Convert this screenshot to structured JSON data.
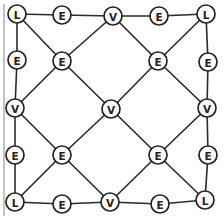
{
  "diagram": {
    "node_radius": 9,
    "nodes": [
      {
        "id": "n00",
        "label": "L",
        "x": 17,
        "y": 14
      },
      {
        "id": "n01",
        "label": "E",
        "x": 62,
        "y": 15
      },
      {
        "id": "n02",
        "label": "V",
        "x": 113,
        "y": 16
      },
      {
        "id": "n03",
        "label": "E",
        "x": 159,
        "y": 16
      },
      {
        "id": "n04",
        "label": "L",
        "x": 206,
        "y": 14
      },
      {
        "id": "n10",
        "label": "E",
        "x": 17,
        "y": 60
      },
      {
        "id": "n11",
        "label": "E",
        "x": 62,
        "y": 61
      },
      {
        "id": "n13",
        "label": "E",
        "x": 158,
        "y": 61
      },
      {
        "id": "n14",
        "label": "E",
        "x": 208,
        "y": 62
      },
      {
        "id": "n20",
        "label": "V",
        "x": 15,
        "y": 108
      },
      {
        "id": "n22",
        "label": "V",
        "x": 111,
        "y": 109
      },
      {
        "id": "n24",
        "label": "V",
        "x": 207,
        "y": 108
      },
      {
        "id": "n30",
        "label": "E",
        "x": 15,
        "y": 155
      },
      {
        "id": "n31",
        "label": "E",
        "x": 62,
        "y": 155
      },
      {
        "id": "n33",
        "label": "E",
        "x": 158,
        "y": 155
      },
      {
        "id": "n34",
        "label": "E",
        "x": 208,
        "y": 155
      },
      {
        "id": "n40",
        "label": "L",
        "x": 15,
        "y": 202
      },
      {
        "id": "n41",
        "label": "E",
        "x": 62,
        "y": 204
      },
      {
        "id": "n42",
        "label": "V",
        "x": 110,
        "y": 202
      },
      {
        "id": "n43",
        "label": "E",
        "x": 160,
        "y": 204
      },
      {
        "id": "n44",
        "label": "L",
        "x": 205,
        "y": 200
      }
    ],
    "edges": [
      [
        "n00",
        "n01"
      ],
      [
        "n01",
        "n02"
      ],
      [
        "n02",
        "n03"
      ],
      [
        "n03",
        "n04"
      ],
      [
        "n40",
        "n41"
      ],
      [
        "n41",
        "n42"
      ],
      [
        "n42",
        "n43"
      ],
      [
        "n43",
        "n44"
      ],
      [
        "n00",
        "n10"
      ],
      [
        "n10",
        "n20"
      ],
      [
        "n20",
        "n30"
      ],
      [
        "n30",
        "n40"
      ],
      [
        "n04",
        "n14"
      ],
      [
        "n14",
        "n24"
      ],
      [
        "n24",
        "n34"
      ],
      [
        "n34",
        "n44"
      ],
      [
        "n00",
        "n11"
      ],
      [
        "n11",
        "n22"
      ],
      [
        "n22",
        "n33"
      ],
      [
        "n33",
        "n44"
      ],
      [
        "n04",
        "n13"
      ],
      [
        "n13",
        "n22"
      ],
      [
        "n22",
        "n31"
      ],
      [
        "n31",
        "n40"
      ],
      [
        "n02",
        "n11"
      ],
      [
        "n11",
        "n20"
      ],
      [
        "n02",
        "n13"
      ],
      [
        "n13",
        "n24"
      ],
      [
        "n20",
        "n31"
      ],
      [
        "n31",
        "n42"
      ],
      [
        "n24",
        "n33"
      ],
      [
        "n33",
        "n42"
      ]
    ]
  },
  "legend_labels": {
    "L": "L",
    "E": "E",
    "V": "V"
  }
}
